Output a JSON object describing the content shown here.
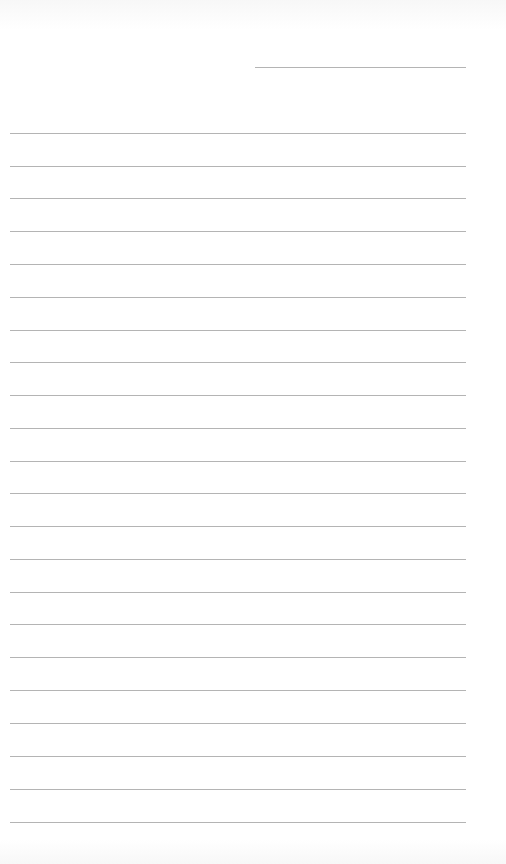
{
  "page": {
    "type": "lined-paper",
    "background": "#ffffff",
    "line_color": "#b4b4b4",
    "header_line": {
      "x": 255,
      "y": 67,
      "width": 211
    },
    "ruled_lines": {
      "count": 22,
      "x": 10,
      "width": 456,
      "y_positions": [
        133,
        166,
        198,
        231,
        264,
        297,
        330,
        362,
        395,
        428,
        461,
        493,
        526,
        559,
        592,
        624,
        657,
        690,
        723,
        756,
        789,
        822
      ]
    }
  }
}
